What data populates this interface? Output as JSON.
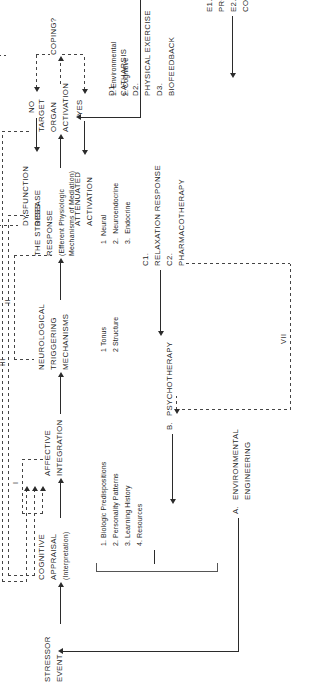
{
  "diagram": {
    "orientation": "rotated-90-ccw",
    "nodes": {
      "stressor_event": {
        "line1": "STRESSOR",
        "line2": "EVENT"
      },
      "cognitive_appraisal": {
        "line1": "COGNITIVE",
        "line2": "APPRAISAL",
        "line3": "(Interpretation)"
      },
      "affective_integration": {
        "line1": "AFFECTIVE",
        "line2": "INTEGRATION"
      },
      "neurological_triggering": {
        "line1": "NEUROLOGICAL",
        "line2": "TRIGGERING",
        "line3": "MECHANISMS"
      },
      "stress_response": {
        "line1": "THE STRESS",
        "line2": "RESPONSE",
        "line3": "(Efferent Physiologic",
        "line4": "Mechanisms of Mediation)"
      },
      "target_organ_activation": {
        "line1": "TARGET",
        "line2": "ORGAN",
        "line3": "ACTIVATION"
      },
      "coping": {
        "label": "COPING?"
      },
      "coping_no": {
        "label": "NO"
      },
      "coping_yes": {
        "label": "YES"
      },
      "dysfunction_disease": {
        "line1": "DYSFUNCTION",
        "line2": "DISEASE"
      },
      "attenuated_activation": {
        "line1": "ATTENUATED",
        "line2": "ACTIVATION"
      }
    },
    "lists": {
      "appraisal_modifiers": [
        "1. Biologic Predispositions",
        "2. Personality Patterns",
        "3. Learning History",
        "4. Resources"
      ],
      "neurological_items": [
        "1 Tonus",
        "2 Structure"
      ],
      "stress_response_items": [
        "1  Neural",
        "2.  Neuroendocrine",
        "3.  Endocrine"
      ],
      "coping_items": [
        "1. Environmental",
        "2. Cognitive"
      ]
    },
    "interventions": {
      "a": {
        "key": "A.",
        "lines": [
          "ENVIRONMENTAL",
          "ENGINEERING"
        ]
      },
      "b": {
        "key": "B.",
        "lines": [
          "PSYCHOTHERAPY"
        ]
      },
      "c": {
        "items": [
          {
            "key": "C1.",
            "label": "RELAXATION RESPONSE"
          },
          {
            "key": "C2.",
            "label": "PHARMACOTHERAPY"
          }
        ]
      },
      "d": {
        "items": [
          {
            "key": "D1.",
            "label": "CATHARSIS"
          },
          {
            "key": "D2.",
            "label": "PHYSICAL EXERCISE"
          },
          {
            "key": "D3.",
            "label": "BIOFEEDBACK"
          }
        ]
      },
      "e": {
        "items": [
          {
            "key": "E1.",
            "label": "PROBLEM SOLVING"
          },
          {
            "key": "E2.",
            "label": "COGNITIVE RESTRUCTURING"
          }
        ]
      }
    },
    "feedback_loops": {
      "i": "I",
      "ii": "II",
      "iii": "III",
      "iv": "IV",
      "v": "V",
      "vi": "VI",
      "vii": "VII"
    },
    "colors": {
      "ink": "#1f1f1f",
      "line": "#2b2b2b",
      "dashed": "#444444",
      "background": "#ffffff"
    }
  }
}
